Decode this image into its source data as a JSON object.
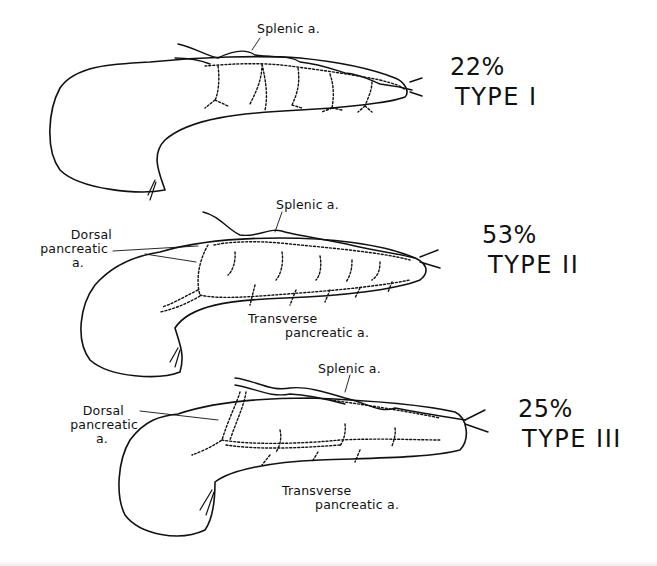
{
  "figure": {
    "stroke_color": "#111111",
    "background": "#ffffff"
  },
  "panels": [
    {
      "id": "type-1",
      "percent": "22%",
      "type_label": "TYPE I",
      "labels": {
        "splenic": "Splenic a."
      }
    },
    {
      "id": "type-2",
      "percent": "53%",
      "type_label": "TYPE II",
      "labels": {
        "splenic": "Splenic a.",
        "dorsal_line1": "Dorsal",
        "dorsal_line2": "pancreatic",
        "dorsal_line3": "a.",
        "transverse_line1": "Transverse",
        "transverse_line2": "pancreatic a."
      }
    },
    {
      "id": "type-3",
      "percent": "25%",
      "type_label": "TYPE III",
      "labels": {
        "splenic": "Splenic a.",
        "dorsal_line1": "Dorsal",
        "dorsal_line2": "pancreatic",
        "dorsal_line3": "a.",
        "transverse_line1": "Transverse",
        "transverse_line2": "pancreatic a."
      }
    }
  ]
}
